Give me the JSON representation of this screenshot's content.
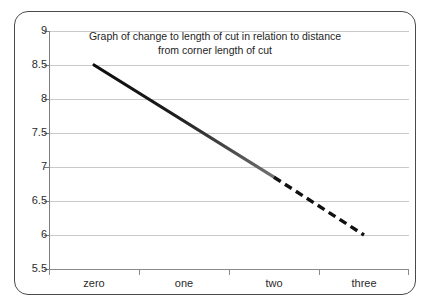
{
  "chart_data": {
    "type": "line",
    "title": "Graph of change to length of cut in relation to distance from corner length of cut",
    "title_lines": [
      "Graph of change to length of cut in relation to distance",
      "from corner length of cut"
    ],
    "xlabel": "",
    "ylabel": "",
    "categories": [
      "zero",
      "one",
      "two",
      "three"
    ],
    "x_tick_labels": [
      "zero",
      "one",
      "two",
      "three"
    ],
    "y_tick_labels": [
      "9",
      "8.5",
      "8",
      "7.5",
      "7",
      "6.5",
      "6",
      "5.5"
    ],
    "y_tick_values": [
      9,
      8.5,
      8,
      7.5,
      7,
      6.5,
      6,
      5.5
    ],
    "ylim": [
      5.5,
      9
    ],
    "grid": true,
    "legend": "none",
    "series": [
      {
        "name": "length of cut",
        "style": "solid",
        "color": "#111111",
        "x": [
          "zero",
          "two"
        ],
        "values": [
          8.5,
          6.85
        ]
      },
      {
        "name": "length of cut (extrapolated)",
        "style": "dashed",
        "color": "#111111",
        "x": [
          "two",
          "three"
        ],
        "values": [
          6.85,
          6.0
        ]
      }
    ],
    "points": [
      {
        "x": "zero",
        "y": 8.5
      },
      {
        "x": "two",
        "y": 6.85
      },
      {
        "x": "three",
        "y": 6.0
      }
    ],
    "colors": {
      "line_start": "#111111",
      "line_end": "#6e6e6e",
      "gridline": "#c9c9c9",
      "axis": "#7d7d7d",
      "border": "#4a4a4a",
      "text": "#2b2b2b",
      "background": "#ffffff"
    }
  }
}
